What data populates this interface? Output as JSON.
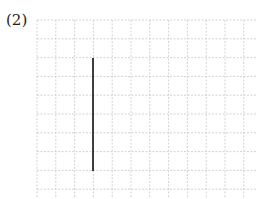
{
  "problem": {
    "label": "(2)"
  },
  "grid": {
    "origin_x": 37,
    "origin_y": 20,
    "cell": 18.8,
    "cols": 12,
    "rows": 10,
    "line_color": "#c8c8c8"
  },
  "segment": {
    "x1": 93,
    "y1": 58,
    "x2": 93,
    "y2": 171,
    "color": "#111111",
    "description": "vertical line segment spanning 6 grid units"
  }
}
